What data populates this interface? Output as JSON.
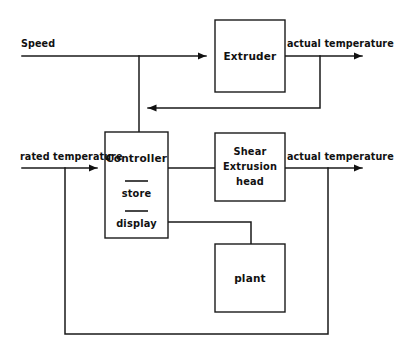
{
  "diagram": {
    "background_color": "#ffffff",
    "line_color": "#1a1a1a",
    "blocks": [
      {
        "id": "extruder",
        "label": "Extruder",
        "x": 215,
        "y": 20,
        "w": 70,
        "h": 72
      },
      {
        "id": "controller",
        "label": "Controller",
        "x": 105,
        "y": 132,
        "w": 63,
        "h": 106
      },
      {
        "id": "shear",
        "label_line1": "Shear",
        "label_line2": "Extrusion",
        "label_line3": "head",
        "x": 215,
        "y": 133,
        "w": 70,
        "h": 68
      },
      {
        "id": "plant",
        "label": "plant",
        "x": 215,
        "y": 244,
        "w": 70,
        "h": 68
      }
    ],
    "controller_items": [
      {
        "id": "store",
        "label": "store"
      },
      {
        "id": "display",
        "label": "display"
      }
    ],
    "signals": [
      {
        "id": "speed",
        "label": "Speed"
      },
      {
        "id": "actual-temp-top",
        "label": "actual temperature"
      },
      {
        "id": "rated-temp",
        "label": "rated temperature"
      },
      {
        "id": "actual-temp-bottom",
        "label": "actual temperature"
      }
    ]
  }
}
